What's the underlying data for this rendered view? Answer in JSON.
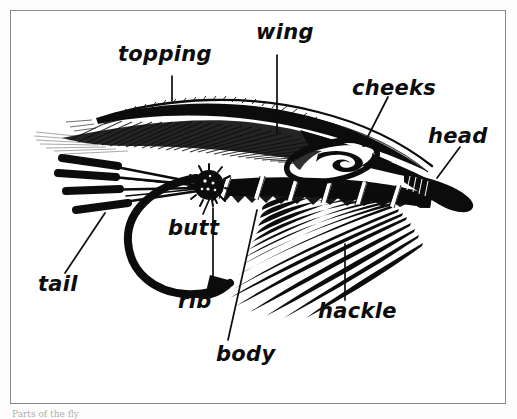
{
  "figure": {
    "frame_color": "#8b8b8b",
    "ink_color": "#0c0c0c",
    "background_color": "#ffffff",
    "caption_partial": "Parts of the fly"
  },
  "labels": [
    {
      "id": "topping",
      "text": "topping",
      "x": 118,
      "y": 54,
      "font_size": 21
    },
    {
      "id": "wing",
      "text": "wing",
      "x": 256,
      "y": 32,
      "font_size": 21
    },
    {
      "id": "cheeks",
      "text": "cheeks",
      "x": 352,
      "y": 88,
      "font_size": 21
    },
    {
      "id": "head",
      "text": "head",
      "x": 428,
      "y": 136,
      "font_size": 21
    },
    {
      "id": "butt",
      "text": "butt",
      "x": 168,
      "y": 227,
      "font_size": 21
    },
    {
      "id": "tail",
      "text": "tail",
      "x": 38,
      "y": 283,
      "font_size": 21
    },
    {
      "id": "rib",
      "text": "rib",
      "x": 178,
      "y": 300,
      "font_size": 21
    },
    {
      "id": "hackle",
      "text": "hackle",
      "x": 318,
      "y": 310,
      "font_size": 21
    },
    {
      "id": "body",
      "text": "body",
      "x": 216,
      "y": 353,
      "font_size": 21
    }
  ],
  "leader_lines": [
    {
      "id": "topping-leader",
      "x1": 172,
      "y1": 76,
      "x2": 172,
      "y2": 101
    },
    {
      "id": "wing-leader",
      "x1": 277,
      "y1": 55,
      "x2": 277,
      "y2": 133
    },
    {
      "id": "cheeks-leader",
      "x1": 388,
      "y1": 97,
      "x2": 363,
      "y2": 146
    },
    {
      "id": "head-leader",
      "x1": 460,
      "y1": 147,
      "x2": 437,
      "y2": 178
    },
    {
      "id": "butt-leader",
      "x1": 203,
      "y1": 214,
      "x2": 212,
      "y2": 193
    },
    {
      "id": "tail-leader",
      "x1": 65,
      "y1": 273,
      "x2": 105,
      "y2": 213
    },
    {
      "id": "rib-leader",
      "x1": 213,
      "y1": 290,
      "x2": 213,
      "y2": 208
    },
    {
      "id": "hackle-leader",
      "x1": 345,
      "y1": 300,
      "x2": 345,
      "y2": 244
    },
    {
      "id": "body-leader",
      "x1": 228,
      "y1": 340,
      "x2": 257,
      "y2": 210
    }
  ],
  "fly_parts": {
    "tail": {
      "name": "tail",
      "fiber_count": 4,
      "description": "four dark rounded-tip fibers radiating to the left"
    },
    "butt": {
      "name": "butt",
      "description": "small round bristly ball of ostrich herl at rear of body"
    },
    "body": {
      "name": "body",
      "description": "tapered dark body along the hook shank"
    },
    "rib": {
      "name": "rib",
      "turn_count": 6,
      "description": "white tinsel ribbing wound in diagonal turns over the body"
    },
    "hackle": {
      "name": "hackle",
      "fiber_count": 16,
      "description": "long fan of fibers sweeping down and back from the throat"
    },
    "wing": {
      "name": "wing",
      "description": "long dark feather wing lying over the body"
    },
    "topping": {
      "name": "topping",
      "description": "fine golden pheasant crest curving over the top of the wing"
    },
    "cheeks": {
      "name": "cheeks",
      "description": "almond-shaped jungle cock cheek near the head"
    },
    "head": {
      "name": "head",
      "description": "tapered lacquered black head at the hook eye"
    },
    "hook": {
      "name": "hook",
      "description": "heavy down-eye salmon hook with curved bend and barbed point"
    }
  }
}
